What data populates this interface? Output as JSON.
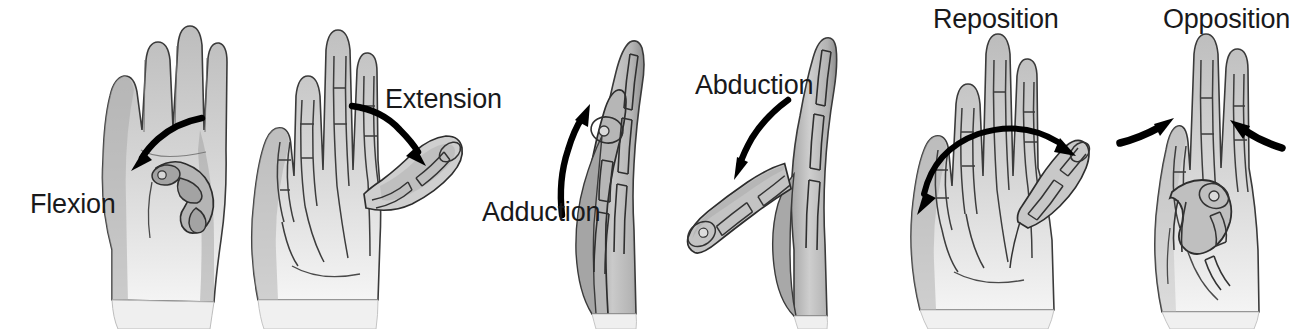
{
  "figure": {
    "background_color": "#ffffff",
    "text_color": "#19191b",
    "arrow_color": "#000000",
    "skin_light": "#e8e8e8",
    "skin_mid": "#b8b8b8",
    "skin_dark": "#8f8f8f",
    "outline_color": "#2a2a2a",
    "bone_fill": "#c9c9c9"
  },
  "panels": [
    {
      "id": "flexion",
      "label": "Flexion",
      "label_x": 30,
      "label_y": 191,
      "arrow": "curved-down-left",
      "arrow_name": "flexion-arrow",
      "hand_view": "palmar-view-thumb-flexed",
      "hand_x": 96,
      "hand_y": 24,
      "hand_w": 132,
      "hand_h": 285
    },
    {
      "id": "extension",
      "label": "Extension",
      "label_x": 385,
      "label_y": 86,
      "arrow": "curved-down-right",
      "arrow_name": "extension-arrow",
      "hand_view": "palmar-view-thumb-extended",
      "hand_x": 248,
      "hand_y": 22,
      "hand_w": 215,
      "hand_h": 290
    },
    {
      "id": "adduction",
      "label": "Adduction",
      "label_x": 482,
      "label_y": 199,
      "arrow": "curved-up-right",
      "arrow_name": "adduction-arrow",
      "hand_view": "lateral-view-thumb-adducted",
      "hand_x": 592,
      "hand_y": 34,
      "hand_w": 84,
      "hand_h": 280
    },
    {
      "id": "abduction",
      "label": "Abduction",
      "label_x": 695,
      "label_y": 72,
      "arrow": "curved-down-left",
      "arrow_name": "abduction-arrow",
      "hand_view": "lateral-view-thumb-abducted",
      "hand_x": 690,
      "hand_y": 36,
      "hand_w": 145,
      "hand_h": 280
    },
    {
      "id": "reposition",
      "label": "Reposition",
      "label_x": 933,
      "label_y": 6,
      "arrow": "double-headed-arc",
      "arrow_name": "reposition-arrow",
      "hand_view": "palmar-view-thumb-repositioned",
      "hand_x": 905,
      "hand_y": 36,
      "hand_w": 200,
      "hand_h": 283
    },
    {
      "id": "opposition",
      "label": "Opposition",
      "label_x": 1163,
      "label_y": 6,
      "arrow": "two-converging-arrows",
      "arrow_name": "opposition-arrows",
      "hand_view": "palmar-view-thumb-opposed",
      "hand_x": 1150,
      "hand_y": 36,
      "hand_w": 145,
      "hand_h": 285
    }
  ]
}
